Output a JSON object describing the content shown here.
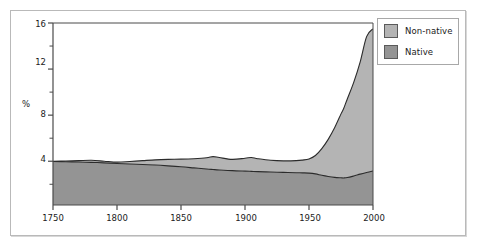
{
  "chart_data": {
    "type": "area",
    "title": "",
    "subtitle": "",
    "xlabel": "",
    "ylabel": "%",
    "stacked": true,
    "grid": false,
    "legend_position": "top-right",
    "xlim": [
      1750,
      2000
    ],
    "ylim": [
      0.2,
      16
    ],
    "xticks": [
      1750,
      1800,
      1850,
      1900,
      1950,
      2000
    ],
    "xtick_labels": [
      "1750",
      "1800",
      "1850",
      "1900",
      "1950",
      "2000"
    ],
    "yticks": [
      4,
      8,
      12,
      16
    ],
    "ytick_labels": [
      "4",
      "8",
      "12",
      "16"
    ],
    "yticks_minor": [
      2,
      6,
      10,
      14
    ],
    "x": [
      1750,
      1760,
      1770,
      1780,
      1790,
      1800,
      1810,
      1820,
      1830,
      1840,
      1850,
      1860,
      1870,
      1875,
      1880,
      1890,
      1900,
      1905,
      1910,
      1920,
      1930,
      1940,
      1945,
      1950,
      1955,
      1960,
      1965,
      1970,
      1975,
      1977,
      1980,
      1985,
      1990,
      1995,
      2000
    ],
    "series": [
      {
        "name": "Native",
        "color": "#949494",
        "values": [
          3.98,
          3.96,
          3.93,
          3.9,
          3.86,
          3.8,
          3.76,
          3.72,
          3.67,
          3.6,
          3.52,
          3.42,
          3.32,
          3.28,
          3.24,
          3.18,
          3.14,
          3.12,
          3.1,
          3.06,
          3.03,
          3.0,
          2.99,
          2.97,
          2.9,
          2.78,
          2.68,
          2.6,
          2.56,
          2.55,
          2.58,
          2.72,
          2.88,
          3.02,
          3.15
        ]
      },
      {
        "name": "Non-native",
        "color": "#b4b4b4",
        "values": [
          0.02,
          0.06,
          0.12,
          0.18,
          0.14,
          0.12,
          0.22,
          0.33,
          0.45,
          0.56,
          0.66,
          0.8,
          0.98,
          1.12,
          1.08,
          0.98,
          1.12,
          1.2,
          1.12,
          1.02,
          1.0,
          1.05,
          1.11,
          1.23,
          1.6,
          2.32,
          3.22,
          4.3,
          5.55,
          6.0,
          6.85,
          8.15,
          9.75,
          11.8,
          12.35
        ]
      }
    ],
    "totals": [
      4.0,
      4.02,
      4.05,
      4.08,
      4.0,
      3.92,
      3.98,
      4.05,
      4.12,
      4.16,
      4.18,
      4.22,
      4.3,
      4.4,
      4.32,
      4.16,
      4.26,
      4.32,
      4.22,
      4.08,
      4.03,
      4.05,
      4.1,
      4.2,
      4.5,
      5.1,
      5.9,
      6.9,
      8.11,
      8.55,
      9.43,
      10.87,
      12.63,
      14.82,
      15.5
    ]
  },
  "legend": {
    "items": [
      {
        "label": "Non-native",
        "color": "#b4b4b4"
      },
      {
        "label": "Native",
        "color": "#949494"
      }
    ]
  },
  "axes": {
    "y_title": "%",
    "y_labels": [
      "16",
      "12",
      "8",
      "4"
    ],
    "x_labels": [
      "1750",
      "1800",
      "1850",
      "1900",
      "1950",
      "2000"
    ]
  },
  "colors": {
    "non_native_fill": "#b4b4b4",
    "native_fill": "#949494",
    "line": "#2b2b2b",
    "axis": "#4a4a4a",
    "frame": "#b9b9b9",
    "background": "#ffffff"
  }
}
